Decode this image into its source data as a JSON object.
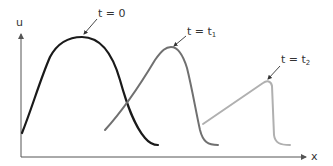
{
  "diagram": {
    "title": "",
    "axes": {
      "y_label": "u",
      "x_label": "x",
      "axis_color": "#555555"
    },
    "curves": [
      {
        "id": "t0",
        "label_main": "t = 0",
        "label_sub": "",
        "color": "#1a1a1a",
        "description": "initial smooth hump profile"
      },
      {
        "id": "t1",
        "label_main": "t = t",
        "label_sub": "1",
        "color": "#707070",
        "description": "steepening wave, front becoming steeper"
      },
      {
        "id": "t2",
        "label_main": "t = t",
        "label_sub": "2",
        "color": "#b0b0b0",
        "description": "nearly shocked profile, linear ramp with vertical front"
      }
    ]
  }
}
